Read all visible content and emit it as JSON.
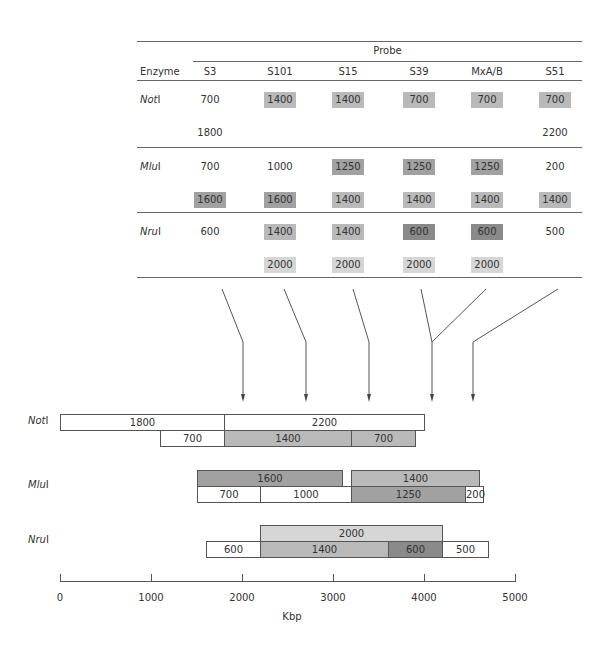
{
  "colors": {
    "white": "#ffffff",
    "light": "#d6d6d6",
    "medium": "#b9b9b9",
    "dark": "#a1a1a1",
    "darkest": "#8a8a8a"
  },
  "table": {
    "group_header": "Probe",
    "enzyme_header": "Enzyme",
    "probes": [
      "S3",
      "S101",
      "S15",
      "S39",
      "MxA/B",
      "S51"
    ],
    "rows": [
      {
        "enzyme": "NotI",
        "enzyme_root": "Not",
        "enzyme_suffix": "I",
        "lines": [
          [
            {
              "v": "700",
              "shade": "white"
            },
            {
              "v": "1400",
              "shade": "medium"
            },
            {
              "v": "1400",
              "shade": "medium"
            },
            {
              "v": "700",
              "shade": "medium"
            },
            {
              "v": "700",
              "shade": "medium"
            },
            {
              "v": "700",
              "shade": "medium"
            }
          ],
          [
            {
              "v": "1800",
              "shade": "white"
            },
            {
              "v": "",
              "shade": "white"
            },
            {
              "v": "",
              "shade": "white"
            },
            {
              "v": "",
              "shade": "white"
            },
            {
              "v": "",
              "shade": "white"
            },
            {
              "v": "2200",
              "shade": "white"
            }
          ]
        ]
      },
      {
        "enzyme": "MluI",
        "enzyme_root": "Mlu",
        "enzyme_suffix": "I",
        "lines": [
          [
            {
              "v": "700",
              "shade": "white"
            },
            {
              "v": "1000",
              "shade": "white"
            },
            {
              "v": "1250",
              "shade": "dark"
            },
            {
              "v": "1250",
              "shade": "dark"
            },
            {
              "v": "1250",
              "shade": "dark"
            },
            {
              "v": "200",
              "shade": "white"
            }
          ],
          [
            {
              "v": "1600",
              "shade": "dark"
            },
            {
              "v": "1600",
              "shade": "dark"
            },
            {
              "v": "1400",
              "shade": "medium"
            },
            {
              "v": "1400",
              "shade": "medium"
            },
            {
              "v": "1400",
              "shade": "medium"
            },
            {
              "v": "1400",
              "shade": "medium"
            }
          ]
        ]
      },
      {
        "enzyme": "NruI",
        "enzyme_root": "Nru",
        "enzyme_suffix": "I",
        "lines": [
          [
            {
              "v": "600",
              "shade": "white"
            },
            {
              "v": "1400",
              "shade": "medium"
            },
            {
              "v": "1400",
              "shade": "medium"
            },
            {
              "v": "600",
              "shade": "darkest"
            },
            {
              "v": "600",
              "shade": "darkest"
            },
            {
              "v": "500",
              "shade": "white"
            }
          ],
          [
            {
              "v": "",
              "shade": "white"
            },
            {
              "v": "2000",
              "shade": "light"
            },
            {
              "v": "2000",
              "shade": "light"
            },
            {
              "v": "2000",
              "shade": "light"
            },
            {
              "v": "2000",
              "shade": "light"
            },
            {
              "v": "",
              "shade": "white"
            }
          ]
        ]
      }
    ]
  },
  "map": {
    "enzymes": [
      {
        "label_root": "Not",
        "label_suffix": "I",
        "top": [
          {
            "start": 0,
            "size": 1800,
            "label": "1800",
            "shade": "white"
          },
          {
            "start": 1800,
            "size": 2200,
            "label": "2200",
            "shade": "white"
          }
        ],
        "bottom": [
          {
            "start": 1100,
            "size": 700,
            "label": "700",
            "shade": "white"
          },
          {
            "start": 1800,
            "size": 1400,
            "label": "1400",
            "shade": "medium"
          },
          {
            "start": 3200,
            "size": 700,
            "label": "700",
            "shade": "medium"
          }
        ]
      },
      {
        "label_root": "Mlu",
        "label_suffix": "I",
        "top": [
          {
            "start": 1500,
            "size": 1600,
            "label": "1600",
            "shade": "dark"
          },
          {
            "start": 3200,
            "size": 1400,
            "label": "1400",
            "shade": "medium"
          }
        ],
        "bottom": [
          {
            "start": 1500,
            "size": 700,
            "label": "700",
            "shade": "white"
          },
          {
            "start": 2200,
            "size": 1000,
            "label": "1000",
            "shade": "white"
          },
          {
            "start": 3200,
            "size": 1250,
            "label": "1250",
            "shade": "dark"
          },
          {
            "start": 4450,
            "size": 200,
            "label": "200",
            "shade": "white"
          }
        ]
      },
      {
        "label_root": "Nru",
        "label_suffix": "I",
        "top": [
          {
            "start": 2200,
            "size": 2000,
            "label": "2000",
            "shade": "light"
          }
        ],
        "bottom": [
          {
            "start": 1600,
            "size": 600,
            "label": "600",
            "shade": "white"
          },
          {
            "start": 2200,
            "size": 1400,
            "label": "1400",
            "shade": "medium"
          },
          {
            "start": 3600,
            "size": 600,
            "label": "600",
            "shade": "darkest"
          },
          {
            "start": 4200,
            "size": 500,
            "label": "500",
            "shade": "white"
          }
        ]
      }
    ],
    "probe_positions": [
      {
        "probe": "S101",
        "kbp": 2000
      },
      {
        "probe": "S15",
        "kbp": 2700
      },
      {
        "probe": "S39",
        "kbp": 3400
      },
      {
        "probe": "MxA/B",
        "kbp": 4100
      },
      {
        "probe": "S51",
        "kbp": 4500
      }
    ],
    "axis": {
      "ticks": [
        "0",
        "1000",
        "2000",
        "3000",
        "4000",
        "5000"
      ],
      "tick_values": [
        0,
        1000,
        2000,
        3000,
        4000,
        5000
      ],
      "label": "Kbp",
      "range": [
        0,
        5000
      ]
    }
  }
}
